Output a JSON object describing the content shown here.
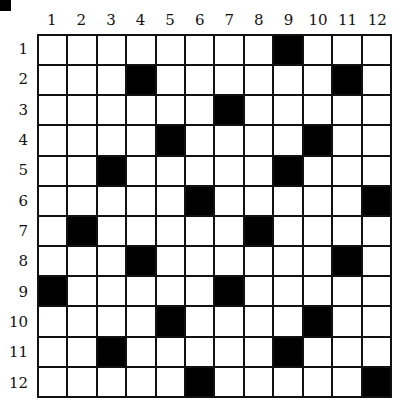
{
  "puzzle": {
    "rows": 12,
    "cols": 12,
    "column_labels": [
      "1",
      "2",
      "3",
      "4",
      "5",
      "6",
      "7",
      "8",
      "9",
      "10",
      "11",
      "12"
    ],
    "row_labels": [
      "1",
      "2",
      "3",
      "4",
      "5",
      "6",
      "7",
      "8",
      "9",
      "10",
      "11",
      "12"
    ],
    "black_cells": [
      [
        1,
        9
      ],
      [
        2,
        4
      ],
      [
        2,
        11
      ],
      [
        3,
        7
      ],
      [
        4,
        5
      ],
      [
        4,
        10
      ],
      [
        5,
        3
      ],
      [
        5,
        9
      ],
      [
        6,
        6
      ],
      [
        6,
        12
      ],
      [
        7,
        2
      ],
      [
        7,
        8
      ],
      [
        8,
        4
      ],
      [
        8,
        11
      ],
      [
        9,
        1
      ],
      [
        9,
        7
      ],
      [
        10,
        5
      ],
      [
        10,
        10
      ],
      [
        11,
        3
      ],
      [
        11,
        9
      ],
      [
        12,
        6
      ],
      [
        12,
        12
      ]
    ],
    "colors": {
      "black": "#000000",
      "white": "#ffffff",
      "line": "#111111"
    }
  }
}
